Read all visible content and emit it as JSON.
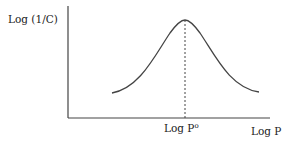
{
  "diagram": {
    "y_axis_label": "Log (1/C)",
    "x_axis_label": "Log P",
    "peak_label": "Log P",
    "peak_label_superscript": "o",
    "curve_type": "bell-shaped parabola",
    "colors": {
      "line": "#444444",
      "text": "#222222"
    }
  }
}
